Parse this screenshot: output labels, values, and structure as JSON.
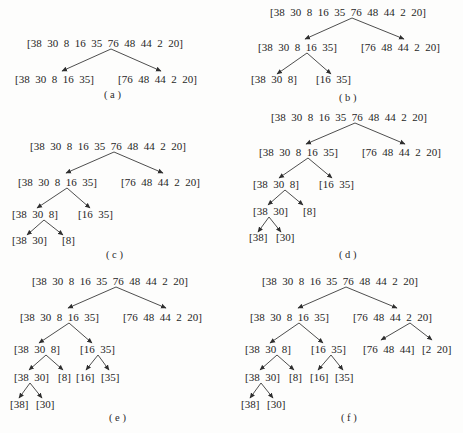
{
  "diagram": {
    "array": [
      38,
      30,
      8,
      16,
      35,
      76,
      48,
      44,
      2,
      20
    ],
    "panels": [
      {
        "id": "a",
        "caption": "( a )",
        "nodes": [
          {
            "id": "a0",
            "label": "[38  30  8  16  35  76  48  44  2  20]",
            "x": 27,
            "y": 47
          },
          {
            "id": "a1",
            "label": "[38  30  8  16  35]",
            "x": 15,
            "y": 83
          },
          {
            "id": "a2",
            "label": "[76  48  44  2  20]",
            "x": 118,
            "y": 83
          }
        ],
        "edges": [
          {
            "from": [
              111,
              49
            ],
            "to": [
              62,
              71
            ]
          },
          {
            "from": [
              111,
              49
            ],
            "to": [
              161,
              71
            ]
          }
        ],
        "caption_pos": [
          104,
          98
        ]
      },
      {
        "id": "b",
        "caption": "( b )",
        "nodes": [
          {
            "id": "b0",
            "label": "[38  30  8  16  35  76  48  44  2  20]",
            "x": 270,
            "y": 16
          },
          {
            "id": "b1",
            "label": "[38  30  8  16  35]",
            "x": 258,
            "y": 51
          },
          {
            "id": "b2",
            "label": "[76  48  44  2  20]",
            "x": 361,
            "y": 51
          },
          {
            "id": "b3",
            "label": "[38  30  8]",
            "x": 251,
            "y": 83
          },
          {
            "id": "b4",
            "label": "[16  35]",
            "x": 316,
            "y": 83
          }
        ],
        "edges": [
          {
            "from": [
              352,
              18
            ],
            "to": [
              305,
              39
            ]
          },
          {
            "from": [
              352,
              18
            ],
            "to": [
              404,
              39
            ]
          },
          {
            "from": [
              307,
              53
            ],
            "to": [
              277,
              74
            ]
          },
          {
            "from": [
              307,
              53
            ],
            "to": [
              331,
              74
            ]
          }
        ],
        "caption_pos": [
          339,
          101
        ]
      },
      {
        "id": "c",
        "caption": "( c )",
        "nodes": [
          {
            "id": "c0",
            "label": "[38  30  8  16  35  76  48  44  2  20]",
            "x": 30,
            "y": 150
          },
          {
            "id": "c1",
            "label": "[38  30  8  16  35]",
            "x": 18,
            "y": 186
          },
          {
            "id": "c2",
            "label": "[76  48  44  2  20]",
            "x": 121,
            "y": 186
          },
          {
            "id": "c3",
            "label": "[38  30  8]",
            "x": 12,
            "y": 218
          },
          {
            "id": "c4",
            "label": "[16  35]",
            "x": 78,
            "y": 218
          },
          {
            "id": "c5",
            "label": "[38  30]",
            "x": 12,
            "y": 244
          },
          {
            "id": "c6",
            "label": "[8]",
            "x": 62,
            "y": 244
          }
        ],
        "edges": [
          {
            "from": [
              114,
              152
            ],
            "to": [
              66,
              173
            ]
          },
          {
            "from": [
              114,
              152
            ],
            "to": [
              163,
              173
            ]
          },
          {
            "from": [
              67,
              188
            ],
            "to": [
              37,
              208
            ]
          },
          {
            "from": [
              67,
              188
            ],
            "to": [
              90,
              208
            ]
          },
          {
            "from": [
              44,
              220
            ],
            "to": [
              27,
              235
            ]
          },
          {
            "from": [
              44,
              220
            ],
            "to": [
              63,
              235
            ]
          }
        ],
        "caption_pos": [
          106,
          258
        ]
      },
      {
        "id": "d",
        "caption": "( d )",
        "nodes": [
          {
            "id": "d0",
            "label": "[38  30  8  16  35  76  48  44  2  20]",
            "x": 271,
            "y": 121
          },
          {
            "id": "d1",
            "label": "[38  30  8  16  35]",
            "x": 259,
            "y": 156
          },
          {
            "id": "d2",
            "label": "[76  48  44  2  20]",
            "x": 362,
            "y": 156
          },
          {
            "id": "d3",
            "label": "[38  30  8]",
            "x": 253,
            "y": 188
          },
          {
            "id": "d4",
            "label": "[16  35]",
            "x": 319,
            "y": 188
          },
          {
            "id": "d5",
            "label": "[38  30]",
            "x": 253,
            "y": 215
          },
          {
            "id": "d6",
            "label": "[8]",
            "x": 303,
            "y": 215
          },
          {
            "id": "d7",
            "label": "[38]",
            "x": 249,
            "y": 241
          },
          {
            "id": "d8",
            "label": "[30]",
            "x": 276,
            "y": 241
          }
        ],
        "edges": [
          {
            "from": [
              355,
              123
            ],
            "to": [
              306,
              144
            ]
          },
          {
            "from": [
              355,
              123
            ],
            "to": [
              405,
              144
            ]
          },
          {
            "from": [
              308,
              158
            ],
            "to": [
              279,
              178
            ]
          },
          {
            "from": [
              308,
              158
            ],
            "to": [
              332,
              178
            ]
          },
          {
            "from": [
              285,
              190
            ],
            "to": [
              268,
              205
            ]
          },
          {
            "from": [
              285,
              190
            ],
            "to": [
              303,
              205
            ]
          },
          {
            "from": [
              269,
              217
            ],
            "to": [
              258,
              232
            ]
          },
          {
            "from": [
              269,
              217
            ],
            "to": [
              281,
              232
            ]
          }
        ],
        "caption_pos": [
          339,
          258
        ]
      },
      {
        "id": "e",
        "caption": "( e )",
        "nodes": [
          {
            "id": "e0",
            "label": "[38  30  8  16  35  76  48  44  2  20]",
            "x": 32,
            "y": 285
          },
          {
            "id": "e1",
            "label": "[38  30  8  16  35]",
            "x": 20,
            "y": 321
          },
          {
            "id": "e2",
            "label": "[76  48  44  2  20]",
            "x": 123,
            "y": 321
          },
          {
            "id": "e3",
            "label": "[38  30  8]",
            "x": 14,
            "y": 353
          },
          {
            "id": "e4",
            "label": "[16  35]",
            "x": 80,
            "y": 353
          },
          {
            "id": "e5",
            "label": "[38  30]",
            "x": 14,
            "y": 381
          },
          {
            "id": "e6",
            "label": "[8]",
            "x": 58,
            "y": 381
          },
          {
            "id": "e7",
            "label": "[16]",
            "x": 76,
            "y": 381
          },
          {
            "id": "e8",
            "label": "[35]",
            "x": 101,
            "y": 381
          },
          {
            "id": "e9",
            "label": "[38]",
            "x": 10,
            "y": 408
          },
          {
            "id": "e10",
            "label": "[30]",
            "x": 36,
            "y": 408
          }
        ],
        "edges": [
          {
            "from": [
              116,
              287
            ],
            "to": [
              68,
              308
            ]
          },
          {
            "from": [
              116,
              287
            ],
            "to": [
              166,
              308
            ]
          },
          {
            "from": [
              69,
              323
            ],
            "to": [
              39,
              343
            ]
          },
          {
            "from": [
              69,
              323
            ],
            "to": [
              92,
              343
            ]
          },
          {
            "from": [
              46,
              355
            ],
            "to": [
              29,
              370
            ]
          },
          {
            "from": [
              46,
              355
            ],
            "to": [
              63,
              370
            ]
          },
          {
            "from": [
              98,
              355
            ],
            "to": [
              86,
              370
            ]
          },
          {
            "from": [
              98,
              355
            ],
            "to": [
              109,
              370
            ]
          },
          {
            "from": [
              30,
              383
            ],
            "to": [
              19,
              398
            ]
          },
          {
            "from": [
              30,
              383
            ],
            "to": [
              42,
              398
            ]
          }
        ],
        "caption_pos": [
          109,
          421
        ]
      },
      {
        "id": "f",
        "caption": "( f )",
        "nodes": [
          {
            "id": "f0",
            "label": "[38  30  8  16  35  76  48  44  2  20]",
            "x": 262,
            "y": 285
          },
          {
            "id": "f1",
            "label": "[38  30  8  16  35]",
            "x": 250,
            "y": 321
          },
          {
            "id": "f2",
            "label": "[76  48  44  2  20]",
            "x": 353,
            "y": 321
          },
          {
            "id": "f3",
            "label": "[38  30  8]",
            "x": 245,
            "y": 353
          },
          {
            "id": "f4",
            "label": "[16  35]",
            "x": 311,
            "y": 353
          },
          {
            "id": "f5",
            "label": "[76  48  44]",
            "x": 363,
            "y": 353
          },
          {
            "id": "f6",
            "label": "[2  20]",
            "x": 422,
            "y": 353
          },
          {
            "id": "f7",
            "label": "[38  30]",
            "x": 245,
            "y": 381
          },
          {
            "id": "f8",
            "label": "[8]",
            "x": 289,
            "y": 381
          },
          {
            "id": "f9",
            "label": "[16]",
            "x": 310,
            "y": 381
          },
          {
            "id": "f10",
            "label": "[35]",
            "x": 335,
            "y": 381
          },
          {
            "id": "f11",
            "label": "[38]",
            "x": 241,
            "y": 408
          },
          {
            "id": "f12",
            "label": "[30]",
            "x": 267,
            "y": 408
          }
        ],
        "edges": [
          {
            "from": [
              346,
              287
            ],
            "to": [
              298,
              308
            ]
          },
          {
            "from": [
              346,
              287
            ],
            "to": [
              397,
              308
            ]
          },
          {
            "from": [
              299,
              323
            ],
            "to": [
              270,
              343
            ]
          },
          {
            "from": [
              299,
              323
            ],
            "to": [
              323,
              343
            ]
          },
          {
            "from": [
              410,
              323
            ],
            "to": [
              381,
              340
            ]
          },
          {
            "from": [
              410,
              323
            ],
            "to": [
              432,
              340
            ]
          },
          {
            "from": [
              277,
              355
            ],
            "to": [
              260,
              370
            ]
          },
          {
            "from": [
              277,
              355
            ],
            "to": [
              294,
              370
            ]
          },
          {
            "from": [
              331,
              355
            ],
            "to": [
              318,
              370
            ]
          },
          {
            "from": [
              331,
              355
            ],
            "to": [
              343,
              370
            ]
          },
          {
            "from": [
              261,
              383
            ],
            "to": [
              250,
              398
            ]
          },
          {
            "from": [
              261,
              383
            ],
            "to": [
              273,
              398
            ]
          }
        ],
        "caption_pos": [
          341,
          421
        ]
      }
    ]
  }
}
